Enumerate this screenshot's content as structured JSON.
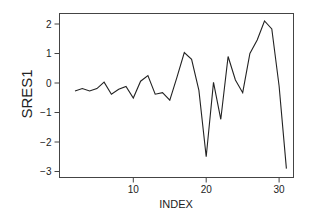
{
  "chart_data": {
    "type": "line",
    "title": "",
    "xlabel": "INDEX",
    "ylabel": "SRES1",
    "xlim": [
      0,
      32
    ],
    "ylim": [
      -3.3,
      2.35
    ],
    "xticks": [
      10,
      20,
      30
    ],
    "yticks": [
      -3,
      -2,
      -1,
      0,
      1,
      2
    ],
    "grid": false,
    "legend": null,
    "series": [
      {
        "name": "SRES1",
        "x": [
          2,
          3,
          4,
          5,
          6,
          7,
          8,
          9,
          10,
          11,
          12,
          13,
          14,
          15,
          16,
          17,
          18,
          19,
          20,
          21,
          22,
          23,
          24,
          25,
          26,
          27,
          28,
          29,
          30,
          31
        ],
        "values": [
          -0.27,
          -0.19,
          -0.27,
          -0.19,
          0.03,
          -0.38,
          -0.21,
          -0.12,
          -0.51,
          0.06,
          0.25,
          -0.38,
          -0.33,
          -0.58,
          0.2,
          1.03,
          0.8,
          -0.25,
          -2.5,
          0.02,
          -1.23,
          0.9,
          0.1,
          -0.33,
          1.0,
          1.46,
          2.1,
          1.83,
          -0.1,
          -2.9
        ]
      }
    ],
    "colors": {
      "line": "#222222",
      "frame": "#444444"
    }
  }
}
